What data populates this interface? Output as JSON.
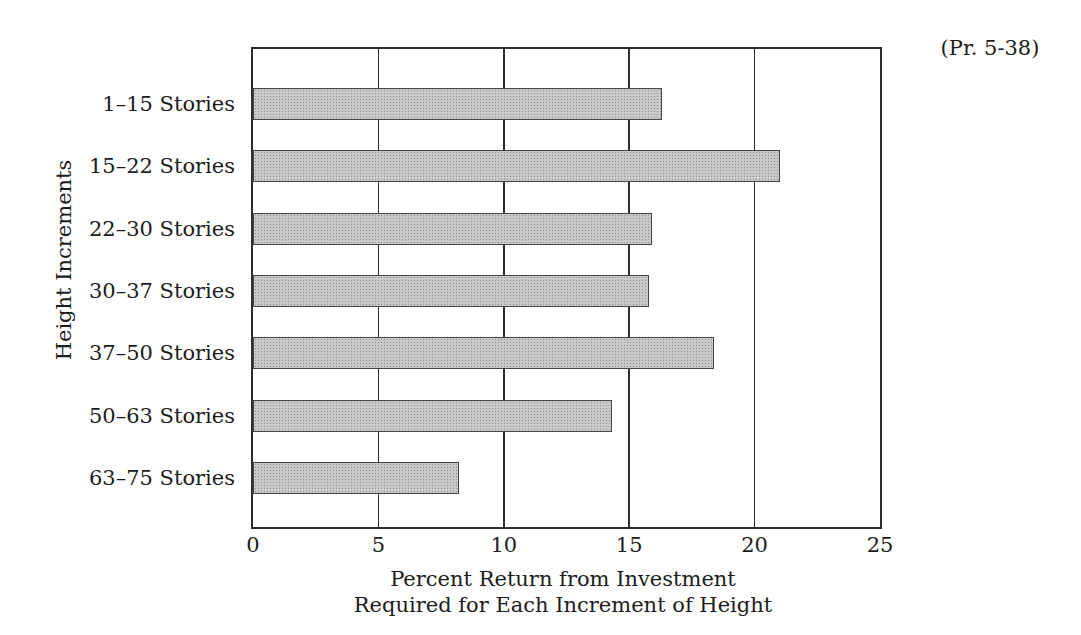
{
  "page": {
    "corner_label": "(Pr. 5-38)"
  },
  "chart_data": {
    "type": "bar",
    "orientation": "horizontal",
    "title": "",
    "categories": [
      "1–15 Stories",
      "15–22 Stories",
      "22–30 Stories",
      "30–37 Stories",
      "37–50 Stories",
      "50–63 Stories",
      "63–75 Stories"
    ],
    "values": [
      16.3,
      21.0,
      15.9,
      15.8,
      18.4,
      14.3,
      8.2
    ],
    "xlabel_lines": [
      "Percent Return from Investment",
      "Required for Each Increment of Height"
    ],
    "ylabel": "Height Increments",
    "xlim": [
      0,
      25
    ],
    "xticks": [
      0,
      5,
      10,
      15,
      20,
      25
    ],
    "grid": true,
    "legend": false,
    "colors": {
      "bar_fill": "#c9c9c9",
      "bar_stipple_dot": "#8f8f8f",
      "bar_border": "#454545",
      "axis_line": "#2e2e2e",
      "text": "#1c1c1c",
      "background": "#ffffff"
    }
  }
}
